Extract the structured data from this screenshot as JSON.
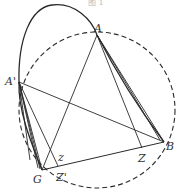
{
  "caption_fragment": "图 1",
  "colors": {
    "stroke": "#2a2a2a",
    "label": "#333333",
    "background": "#ffffff"
  },
  "points": {
    "A": {
      "label": "A",
      "x": 97,
      "y": 35
    },
    "A_prime": {
      "label": "A'",
      "x": 19,
      "y": 82
    },
    "G": {
      "label": "G",
      "x": 42,
      "y": 170
    },
    "B": {
      "label": "B",
      "x": 164,
      "y": 142
    },
    "Z": {
      "label": "Z",
      "x": 142,
      "y": 148
    },
    "Z_prime": {
      "label": "Z'",
      "x": 58,
      "y": 166
    },
    "z": {
      "label": "z",
      "x": 50,
      "y": 156
    }
  },
  "circle": {
    "cx": 97,
    "cy": 110,
    "r": 78,
    "style": "dashed"
  },
  "curve": {
    "style": "solid",
    "description": "loop from G through A' up over top through A to B"
  },
  "segments": [
    [
      "A",
      "G"
    ],
    [
      "A",
      "Z"
    ],
    [
      "A",
      "B"
    ],
    [
      "A_prime",
      "B"
    ],
    [
      "A_prime",
      "G"
    ],
    [
      "A_prime",
      "Z_prime"
    ],
    [
      "G",
      "B"
    ]
  ]
}
